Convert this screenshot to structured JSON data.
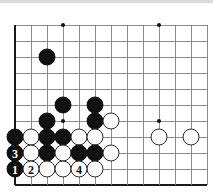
{
  "diagram": {
    "type": "go-board-problem",
    "board": {
      "origin_x": 15,
      "origin_y": 25,
      "spacing": 16,
      "columns": 13,
      "rows": 11,
      "left_edge_is_border": true,
      "bottom_edge_is_border": true
    },
    "star_points": [
      {
        "col": 3,
        "row": 0
      },
      {
        "col": 9,
        "row": 0
      },
      {
        "col": 3,
        "row": 6
      },
      {
        "col": 9,
        "row": 6
      }
    ],
    "stones": [
      {
        "col": 2,
        "row": 2,
        "color": "black",
        "label": ""
      },
      {
        "col": 3,
        "row": 5,
        "color": "black",
        "label": ""
      },
      {
        "col": 5,
        "row": 5,
        "color": "black",
        "label": ""
      },
      {
        "col": 2,
        "row": 6,
        "color": "black",
        "label": ""
      },
      {
        "col": 5,
        "row": 6,
        "color": "black",
        "label": ""
      },
      {
        "col": 6,
        "row": 6,
        "color": "white",
        "label": ""
      },
      {
        "col": 0,
        "row": 7,
        "color": "black",
        "label": ""
      },
      {
        "col": 1,
        "row": 7,
        "color": "white",
        "label": ""
      },
      {
        "col": 2,
        "row": 7,
        "color": "black",
        "label": ""
      },
      {
        "col": 3,
        "row": 7,
        "color": "black",
        "label": ""
      },
      {
        "col": 4,
        "row": 7,
        "color": "white",
        "label": ""
      },
      {
        "col": 5,
        "row": 7,
        "color": "white",
        "label": ""
      },
      {
        "col": 9,
        "row": 7,
        "color": "white",
        "label": ""
      },
      {
        "col": 11,
        "row": 7,
        "color": "white",
        "label": ""
      },
      {
        "col": 0,
        "row": 8,
        "color": "black",
        "label": "3"
      },
      {
        "col": 1,
        "row": 8,
        "color": "white",
        "label": ""
      },
      {
        "col": 2,
        "row": 8,
        "color": "black",
        "label": ""
      },
      {
        "col": 3,
        "row": 8,
        "color": "white",
        "label": ""
      },
      {
        "col": 4,
        "row": 8,
        "color": "black",
        "label": ""
      },
      {
        "col": 5,
        "row": 8,
        "color": "black",
        "label": ""
      },
      {
        "col": 6,
        "row": 8,
        "color": "white",
        "label": ""
      },
      {
        "col": 0,
        "row": 9,
        "color": "black",
        "label": "1"
      },
      {
        "col": 1,
        "row": 9,
        "color": "white",
        "label": "2"
      },
      {
        "col": 2,
        "row": 9,
        "color": "white",
        "label": ""
      },
      {
        "col": 3,
        "row": 9,
        "color": "white",
        "label": ""
      },
      {
        "col": 4,
        "row": 9,
        "color": "white",
        "label": "4"
      },
      {
        "col": 5,
        "row": 9,
        "color": "white",
        "label": ""
      }
    ],
    "move_labels": [
      "1",
      "2",
      "3",
      "4"
    ],
    "colors": {
      "grid": "#8c8c8c",
      "border": "#1a1a1a",
      "black_stone": "#111111",
      "white_stone": "#ffffff",
      "white_stone_outline": "#2a2a2a",
      "background": "#ffffff"
    }
  }
}
